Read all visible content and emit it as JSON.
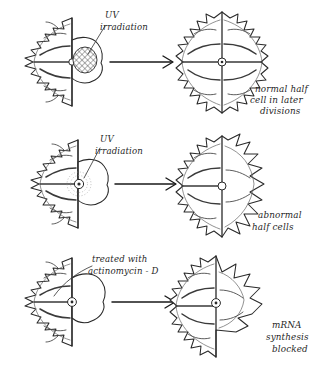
{
  "figure": {
    "background_color": "#ffffff",
    "ink_color": "#2a2a2a",
    "style": "hand-drawn pen-and-ink biological diagram"
  },
  "rows": [
    {
      "id": "row-uv-cytoplasm",
      "treatment_label": {
        "line1": "UV",
        "line2": "irradiation"
      },
      "outcome_caption": {
        "line1": "normal half",
        "line2": "cell in later",
        "line3": "divisions"
      },
      "source_cell": {
        "name": "half-cell-with-irradiated-cytoplasm",
        "nucleus_style": "cross-hatched-patch",
        "left_half": "fully-lobed",
        "right_half": "smooth-rounded-bud"
      },
      "result_cell": {
        "name": "normal-full-cell",
        "nucleus_style": "small-circle-with-dot",
        "left_half": "fully-lobed",
        "right_half": "fully-lobed"
      },
      "arrow": "rightwards-arrow"
    },
    {
      "id": "row-uv-nucleus",
      "treatment_label": {
        "line1": "UV",
        "line2": "irradiation"
      },
      "outcome_caption": {
        "line1": "abnormal",
        "line2": "half cells",
        "line3": ""
      },
      "source_cell": {
        "name": "half-cell-with-irradiated-nucleus",
        "nucleus_style": "circle-with-stippled-halo",
        "left_half": "fully-lobed",
        "right_half": "smooth-rounded-bud"
      },
      "result_cell": {
        "name": "abnormal-full-cell",
        "nucleus_style": "small-circle",
        "left_half": "fully-lobed",
        "right_half": "malformed-blunt-lobes"
      },
      "arrow": "rightwards-arrow"
    },
    {
      "id": "row-actinomycin",
      "treatment_label": {
        "line1": "treated with",
        "line2": "actinomycin - D"
      },
      "outcome_caption": {
        "line1": "mRNA",
        "line2": "synthesis",
        "line3": "blocked"
      },
      "source_cell": {
        "name": "half-cell-treated-with-actinomycin",
        "nucleus_style": "small-circle-with-dot",
        "left_half": "fully-lobed",
        "right_half": "smooth-rounded-bud"
      },
      "result_cell": {
        "name": "blocked-synthesis-cell",
        "nucleus_style": "small-circle-with-dot",
        "left_half": "fully-lobed",
        "right_half": "broad-finger-lobes"
      },
      "arrow": "rightwards-arrow"
    }
  ]
}
